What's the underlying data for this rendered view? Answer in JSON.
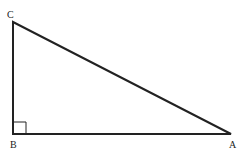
{
  "diagram": {
    "type": "right-triangle",
    "vertices": [
      {
        "label": "C",
        "x": 13,
        "y": 22
      },
      {
        "label": "B",
        "x": 13,
        "y": 134
      },
      {
        "label": "A",
        "x": 231,
        "y": 134
      }
    ],
    "right_angle_at": "B",
    "stroke_color": "#222222"
  }
}
